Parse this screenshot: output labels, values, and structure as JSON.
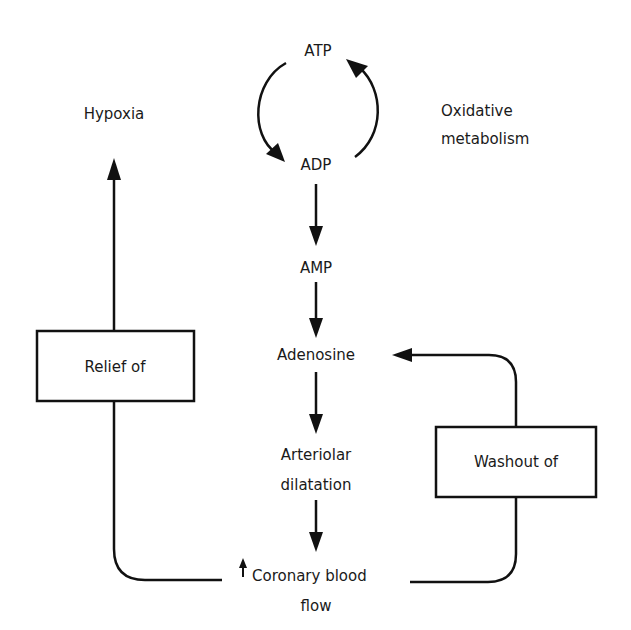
{
  "diagram": {
    "type": "flow",
    "colors": {
      "ink": "#111111",
      "background": "#ffffff"
    },
    "nodes": {
      "atp": "ATP",
      "adp": "ADP",
      "oxidative_line1": "Oxidative",
      "oxidative_line2": "metabolism",
      "amp": "AMP",
      "adenosine": "Adenosine",
      "arteriolar_line1": "Arteriolar",
      "arteriolar_line2": "dilatation",
      "coronary_line1": "Coronary blood",
      "coronary_line2": "flow",
      "coronary_prefix_icon": "up-arrow-icon",
      "hypoxia": "Hypoxia",
      "relief_box": "Relief of",
      "washout_box": "Washout of"
    },
    "edges": [
      {
        "from": "ATP",
        "to": "ADP",
        "style": "curved-left"
      },
      {
        "from": "ADP",
        "to": "ATP",
        "style": "curved-right",
        "label": "Oxidative metabolism"
      },
      {
        "from": "ADP",
        "to": "AMP"
      },
      {
        "from": "AMP",
        "to": "Adenosine"
      },
      {
        "from": "Adenosine",
        "to": "Arteriolar dilatation"
      },
      {
        "from": "Arteriolar dilatation",
        "to": "Coronary blood flow"
      },
      {
        "from": "Coronary blood flow",
        "to": "Hypoxia",
        "via": "Relief of"
      },
      {
        "from": "Coronary blood flow",
        "to": "Adenosine",
        "via": "Washout of"
      }
    ]
  }
}
